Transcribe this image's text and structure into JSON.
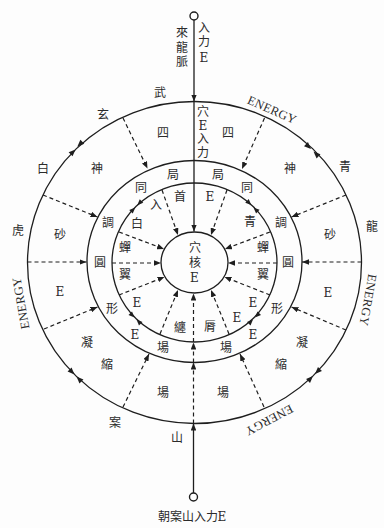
{
  "diagram": {
    "top_input": {
      "source": "來龍脈",
      "input": "入力E"
    },
    "axis_input": "穴E入力",
    "core": "穴核E",
    "bottom_input": {
      "label": "朝案山入力E"
    },
    "guardians": {
      "north": "玄武",
      "west": "白虎",
      "east": "青龍",
      "south": "案山"
    },
    "energy_labels": [
      "ENERGY",
      "ENERGY",
      "ENERGY",
      "ENERGY"
    ],
    "outer_ring": {
      "left": [
        "四",
        "神",
        "砂",
        "E",
        "凝",
        "縮",
        "場"
      ],
      "right": [
        "四",
        "神",
        "砂",
        "E",
        "凝",
        "縮",
        "場"
      ]
    },
    "middle_ring": {
      "left": [
        "局",
        "同",
        "調",
        "圓",
        "形",
        "E",
        "場"
      ],
      "right": [
        "局",
        "同",
        "調",
        "圓",
        "形",
        "E",
        "場"
      ]
    },
    "inner_ring": {
      "left": [
        "首",
        "入",
        "白",
        "蟬",
        "翼",
        "E",
        "纏"
      ],
      "right": [
        "E",
        "青",
        "蟬",
        "翼",
        "E",
        "E",
        "脣"
      ]
    },
    "colors": {
      "line": "#1e1e1e",
      "text": "#2b2b2b",
      "background": "#fdfdfd"
    }
  }
}
